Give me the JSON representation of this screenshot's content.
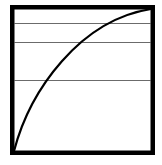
{
  "diagram": {
    "type": "saturating-curve-diagram",
    "frame": {
      "x": 12.25,
      "y": 7.25,
      "width": 140.5,
      "height": 145.5,
      "stroke": "#000000",
      "stroke_width": 4.5
    },
    "horizontal_lines": [
      {
        "y": 23.5,
        "color": "#6b6b6b"
      },
      {
        "y": 42.5,
        "color": "#6b6b6b"
      },
      {
        "y": 80.5,
        "color": "#6b6b6b"
      }
    ],
    "curve": {
      "description": "concave-down rising curve from bottom-left to top-right corner",
      "start": [
        14,
        151
      ],
      "control1": [
        30,
        90
      ],
      "control2": [
        80,
        20
      ],
      "end": [
        151,
        9
      ],
      "stroke": "#000000",
      "stroke_width": 2.2
    },
    "background": "#ffffff"
  }
}
